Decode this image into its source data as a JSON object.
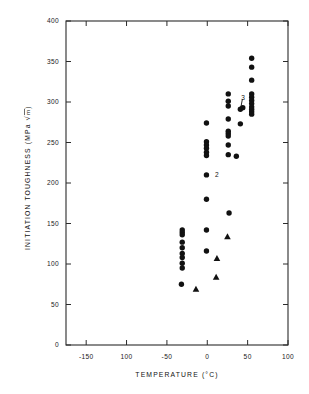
{
  "chart_data": {
    "type": "scatter",
    "title": "",
    "xlabel": "TEMPERATURE (°C)",
    "ylabel": "INITIATION  TOUGHNESS (MPa √m)",
    "ylabel_parts": {
      "line": "INITIATION    TOUGHNESS (MPa",
      "radical": "√",
      "radicand": "m",
      "closing": ")"
    },
    "xlim": [
      -175,
      100
    ],
    "ylim": [
      0,
      400
    ],
    "xticks": [
      -150,
      -100,
      -50,
      0,
      50,
      100
    ],
    "xticklabels": [
      "-150",
      "100",
      "-50",
      "0",
      "50",
      "100"
    ],
    "yticks": [
      0,
      50,
      100,
      150,
      200,
      250,
      300,
      350,
      400
    ],
    "yticklabels": [
      "0",
      "50",
      "100",
      "150",
      "200",
      "250",
      "300",
      "350",
      "400"
    ],
    "grid": false,
    "legend": null,
    "tick_direction": "in",
    "frame": "box",
    "marker_color": "#111111",
    "series": [
      {
        "name": "circles",
        "marker": "circle",
        "points": [
          [
            -31,
            142
          ],
          [
            -31,
            139
          ],
          [
            -31,
            136
          ],
          [
            -31,
            127
          ],
          [
            -31,
            120
          ],
          [
            -31,
            113
          ],
          [
            -31,
            108
          ],
          [
            -31,
            101
          ],
          [
            -31,
            95
          ],
          [
            -32,
            75
          ],
          [
            -1,
            274
          ],
          [
            -1,
            251
          ],
          [
            -1,
            247
          ],
          [
            -1,
            243
          ],
          [
            -1,
            238
          ],
          [
            -1,
            234
          ],
          [
            -1,
            210
          ],
          [
            -1,
            180
          ],
          [
            -1,
            142
          ],
          [
            -1,
            116
          ],
          [
            26,
            310
          ],
          [
            26,
            301
          ],
          [
            26,
            295
          ],
          [
            26,
            279
          ],
          [
            26,
            264
          ],
          [
            26,
            261
          ],
          [
            26,
            258
          ],
          [
            26,
            247
          ],
          [
            26,
            235
          ],
          [
            27,
            163
          ],
          [
            36,
            233
          ],
          [
            41,
            273
          ],
          [
            41,
            291
          ],
          [
            44,
            293
          ],
          [
            55,
            354
          ],
          [
            55,
            343
          ],
          [
            55,
            327
          ],
          [
            55,
            310
          ],
          [
            55,
            306
          ],
          [
            55,
            302
          ],
          [
            55,
            298
          ],
          [
            55,
            294
          ],
          [
            55,
            291
          ],
          [
            55,
            288
          ],
          [
            55,
            285
          ]
        ]
      },
      {
        "name": "triangles",
        "marker": "triangle",
        "points": [
          [
            -14,
            69
          ],
          [
            11,
            84
          ],
          [
            12,
            107
          ],
          [
            25,
            134
          ]
        ]
      }
    ],
    "annotations": [
      {
        "text": "2",
        "x": 1,
        "y": 210,
        "dx": 7,
        "dy": 0,
        "leader": false
      },
      {
        "text": "3",
        "x": 42,
        "y": 305,
        "dx": 0,
        "dy": 0,
        "leader": true,
        "leader_to": [
          41,
          291
        ]
      }
    ]
  }
}
